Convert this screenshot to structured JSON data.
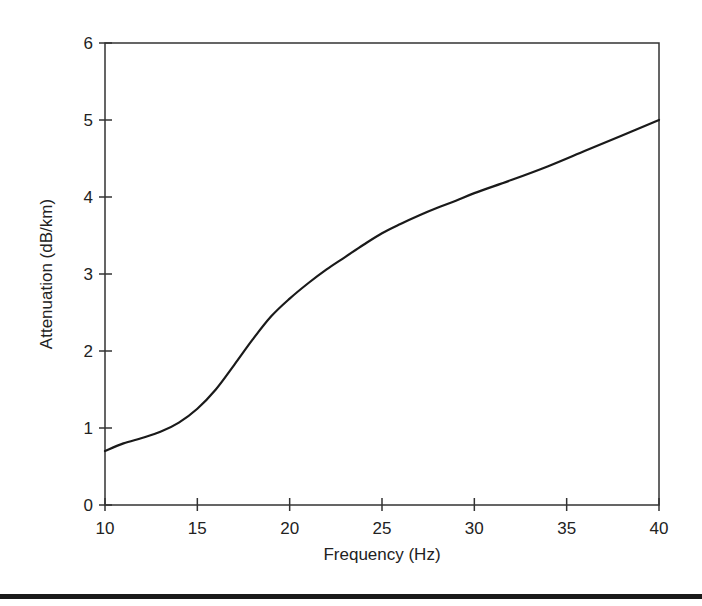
{
  "chart_data": {
    "type": "line",
    "title": "",
    "xlabel": "Frequency (Hz)",
    "ylabel": "Attenuation (dB/km)",
    "xlim": [
      10,
      40
    ],
    "ylim": [
      0,
      6
    ],
    "xticks": [
      10,
      15,
      20,
      25,
      30,
      35,
      40
    ],
    "yticks": [
      0,
      1,
      2,
      3,
      4,
      5,
      6
    ],
    "grid": false,
    "legend": null,
    "series": [
      {
        "name": "Attenuation",
        "color": "#1a1a1a",
        "x": [
          10,
          11,
          12,
          13,
          14,
          15,
          16,
          17,
          18,
          19,
          20,
          21,
          22,
          23,
          24,
          25,
          26,
          27,
          28,
          29,
          30,
          32,
          34,
          36,
          38,
          40
        ],
        "y": [
          0.7,
          0.8,
          0.87,
          0.95,
          1.07,
          1.25,
          1.5,
          1.82,
          2.15,
          2.45,
          2.68,
          2.88,
          3.06,
          3.22,
          3.38,
          3.53,
          3.65,
          3.76,
          3.86,
          3.95,
          4.05,
          4.22,
          4.4,
          4.6,
          4.8,
          5.0
        ]
      }
    ]
  },
  "plot_area": {
    "left": 105,
    "right": 659,
    "top": 43,
    "bottom": 505
  }
}
